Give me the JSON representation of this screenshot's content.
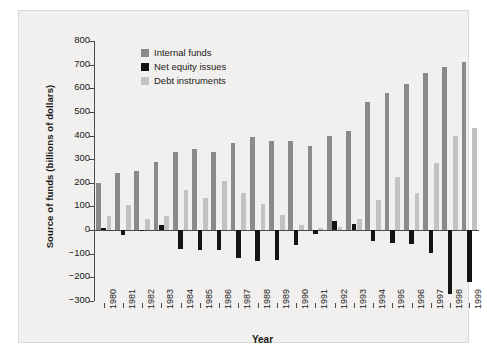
{
  "chart_data": {
    "type": "bar",
    "title": "",
    "xlabel": "Year",
    "ylabel": "Source of funds (billions of dollars)",
    "ylim": [
      -300,
      800
    ],
    "ytick_step": 100,
    "yticks": [
      "800",
      "700",
      "600",
      "500",
      "400",
      "300",
      "200",
      "100",
      "0",
      "−100",
      "−200",
      "−300"
    ],
    "grid": false,
    "legend_position": "top-left-inside",
    "categories": [
      "1980",
      "1981",
      "1982",
      "1983",
      "1984",
      "1985",
      "1986",
      "1987",
      "1988",
      "1989",
      "1990",
      "1991",
      "1992",
      "1993",
      "1994",
      "1995",
      "1996",
      "1997",
      "1998",
      "1999"
    ],
    "series": [
      {
        "name": "Internal funds",
        "color": "#8a8a8a",
        "values": [
          198,
          240,
          248,
          290,
          330,
          345,
          330,
          370,
          395,
          375,
          375,
          355,
          400,
          420,
          540,
          580,
          620,
          665,
          690,
          710
        ]
      },
      {
        "name": "Net equity issues",
        "color": "#141414",
        "values": [
          10,
          -20,
          -5,
          20,
          -80,
          -85,
          -85,
          -120,
          -130,
          -125,
          -65,
          -15,
          40,
          25,
          -45,
          -55,
          -60,
          -95,
          -270,
          -220
        ]
      },
      {
        "name": "Debt instruments",
        "color": "#c2c2c2",
        "values": [
          58,
          105,
          45,
          60,
          170,
          135,
          208,
          155,
          110,
          65,
          20,
          10,
          12,
          45,
          128,
          225,
          155,
          285,
          400,
          430
        ]
      }
    ]
  },
  "legend": {
    "items": [
      {
        "label": "Internal funds",
        "color": "#8a8a8a",
        "swatch_name": "legend-swatch-internal-funds"
      },
      {
        "label": "Net equity issues",
        "color": "#141414",
        "swatch_name": "legend-swatch-net-equity-issues"
      },
      {
        "label": "Debt instruments",
        "color": "#c2c2c2",
        "swatch_name": "legend-swatch-debt-instruments"
      }
    ]
  },
  "axes": {
    "x_title": "Year",
    "y_title": "Source of funds (billions of dollars)"
  }
}
